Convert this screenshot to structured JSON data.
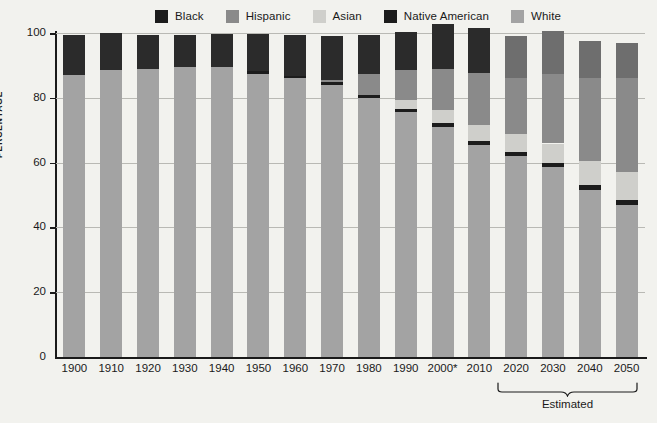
{
  "chart_data": {
    "type": "bar",
    "subtype": "stacked-bar-100",
    "title": "",
    "xlabel": "",
    "ylabel": "PERCENTAGE",
    "ylim": [
      0,
      100
    ],
    "yticks": [
      0,
      20,
      40,
      60,
      80,
      100
    ],
    "grid": true,
    "legend_position": "top",
    "categories": [
      "1900",
      "1910",
      "1920",
      "1930",
      "1940",
      "1950",
      "1960",
      "1970",
      "1980",
      "1990",
      "2000*",
      "2010",
      "2020",
      "2030",
      "2040",
      "2050"
    ],
    "series": [
      {
        "name": "White",
        "color": "#a3a3a3",
        "values": [
          87,
          88.5,
          89,
          89.5,
          89.5,
          87.5,
          86,
          84,
          80,
          75.5,
          71,
          65.5,
          62,
          58.5,
          51.5,
          47
        ]
      },
      {
        "name": "Native American",
        "color": "#1c1c1c",
        "values": [
          0,
          0,
          0,
          0,
          0,
          0.7,
          0.8,
          0.8,
          0.9,
          1,
          1.3,
          1.3,
          1.4,
          1.4,
          1.5,
          1.5
        ]
      },
      {
        "name": "Asian",
        "color": "#cfcfcb",
        "values": [
          0,
          0,
          0,
          0,
          0,
          0,
          0,
          0,
          0,
          2.8,
          3.9,
          4.7,
          5.3,
          6,
          7.5,
          8.5
        ]
      },
      {
        "name": "Hispanic",
        "color": "#8a8a8a",
        "values": [
          0,
          0,
          0,
          0,
          0,
          0,
          0,
          0.7,
          6.3,
          9.2,
          12.6,
          16.3,
          17.5,
          21.5,
          25.5,
          29
        ]
      },
      {
        "name": "Black",
        "color": "#2b2b2b",
        "values": [
          12.5,
          11.5,
          10.5,
          10,
          10.3,
          11.6,
          12.6,
          13.6,
          12.2,
          11.8,
          14.1,
          13.6,
          0,
          0,
          0,
          0
        ]
      },
      {
        "name": "Black (proj)",
        "color": "#6e6e6e",
        "values": [
          0,
          0,
          0,
          0,
          0,
          0,
          0,
          0,
          0,
          0,
          0,
          0,
          12.8,
          13.2,
          11.5,
          11
        ]
      }
    ],
    "legend_entries": [
      {
        "label": "Black",
        "color": "#1c1c1c"
      },
      {
        "label": "Hispanic",
        "color": "#8a8a8a"
      },
      {
        "label": "Asian",
        "color": "#cfcfcb"
      },
      {
        "label": "Native American",
        "color": "#1c1c1c"
      },
      {
        "label": "White",
        "color": "#a3a3a3"
      }
    ],
    "annotations": [
      {
        "text": "Estimated",
        "covers": [
          "2020",
          "2030",
          "2040",
          "2050"
        ]
      }
    ],
    "footnote_marker": "*"
  },
  "axis": {
    "y_title": "PERCENTAGE",
    "y_ticks": [
      "0",
      "20",
      "40",
      "60",
      "80",
      "100"
    ]
  },
  "bracket": {
    "label": "Estimated"
  },
  "colors": {
    "background": "#f2f2ee",
    "axis": "#1a1a1a",
    "grid": "#b9b9b4",
    "black": "#1c1c1c",
    "black_projected": "#6e6e6e",
    "hispanic": "#8a8a8a",
    "asian": "#cfcfcb",
    "native_american": "#1c1c1c",
    "white": "#a3a3a3"
  }
}
